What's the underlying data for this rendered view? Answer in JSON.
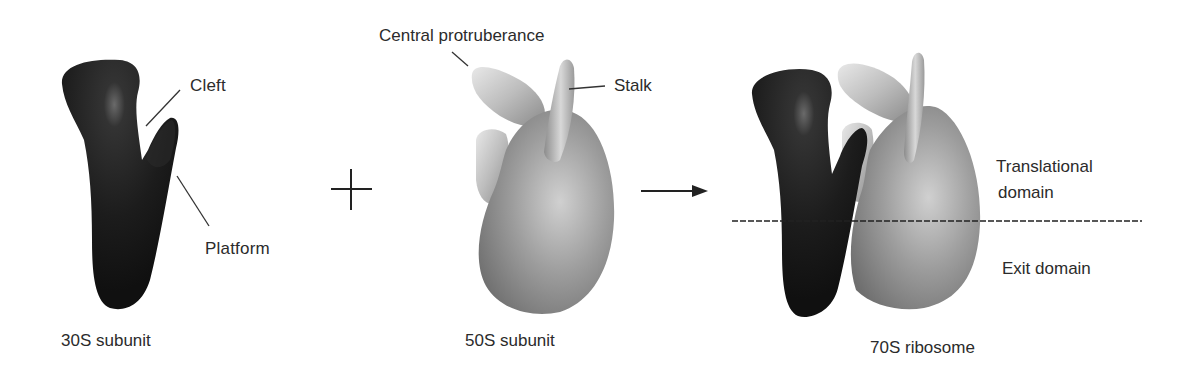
{
  "figure": {
    "panels": [
      {
        "id": "30s",
        "caption": "30S subunit",
        "color": "#1e1e1e",
        "labels": {
          "cleft": "Cleft",
          "platform": "Platform"
        }
      },
      {
        "id": "50s",
        "caption": "50S subunit",
        "color": "#8c8c8c",
        "labels": {
          "central_protuberance": "Central protruberance",
          "stalk": "Stalk"
        }
      },
      {
        "id": "70s",
        "caption": "70S ribosome",
        "labels": {
          "translational_domain_line1": "Translational",
          "translational_domain_line2": "domain",
          "exit_domain": "Exit domain"
        }
      }
    ],
    "operators": {
      "plus": "plus-sign",
      "arrow": "arrow-right"
    }
  }
}
